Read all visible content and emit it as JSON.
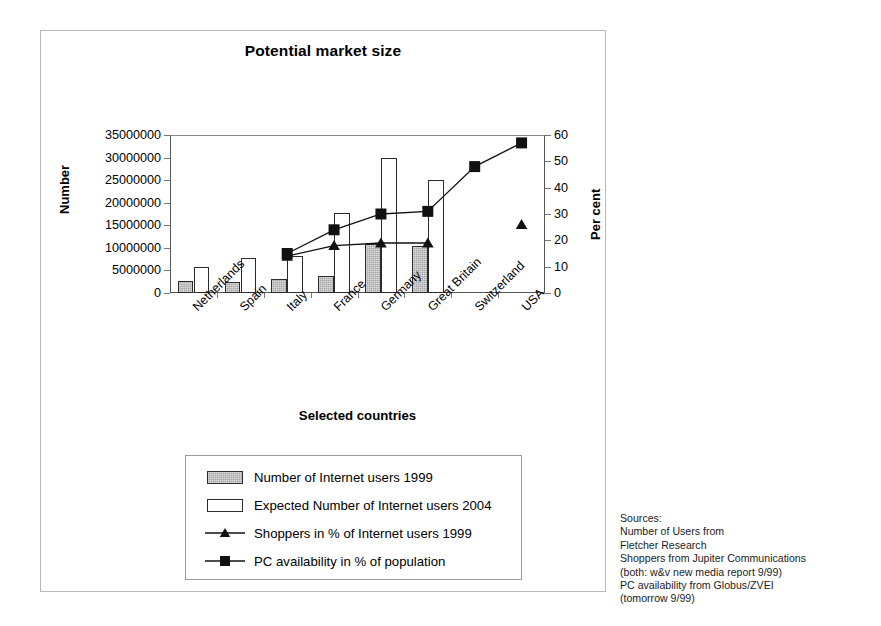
{
  "chart_data": {
    "type": "bar",
    "title": "Potential market size",
    "xlabel": "Selected countries",
    "ylabel": "Number",
    "y2label": "Per cent",
    "categories": [
      "Netherlands",
      "Spain",
      "Italy",
      "France",
      "Germany",
      "Great Britain",
      "Switzerland",
      "USA"
    ],
    "ylim": [
      0,
      35000000
    ],
    "y2lim": [
      0,
      60
    ],
    "yticks": [
      0,
      5000000,
      10000000,
      15000000,
      20000000,
      25000000,
      30000000,
      35000000
    ],
    "ytick_labels": [
      "0",
      "5000000",
      "10000000",
      "15000000",
      "20000000",
      "25000000",
      "30000000",
      "35000000"
    ],
    "y2ticks": [
      0,
      10,
      20,
      30,
      40,
      50,
      60
    ],
    "y2tick_labels": [
      "0",
      "10",
      "20",
      "30",
      "40",
      "50",
      "60"
    ],
    "grid": false,
    "legend_position": "below-plot",
    "series": [
      {
        "name": "Number of Internet users 1999",
        "type": "bar",
        "axis": "left",
        "marker": "filled-gray-rect",
        "values": [
          2600000,
          2500000,
          3000000,
          3800000,
          10800000,
          10500000,
          null,
          null
        ]
      },
      {
        "name": "Expected Number of Internet users 2004",
        "type": "bar",
        "axis": "left",
        "marker": "white-rect",
        "values": [
          5800000,
          7800000,
          8200000,
          17700000,
          30000000,
          25000000,
          null,
          null
        ]
      },
      {
        "name": "Shoppers in % of Internet users 1999",
        "type": "line",
        "axis": "right",
        "marker": "filled-triangle",
        "values": [
          null,
          null,
          14,
          18,
          19,
          19,
          null,
          26
        ]
      },
      {
        "name": "PC availability in % of population",
        "type": "line",
        "axis": "right",
        "marker": "filled-square",
        "values": [
          null,
          null,
          15,
          24,
          30,
          31,
          48,
          57
        ]
      }
    ]
  },
  "sources": {
    "lines": [
      "Sources:",
      "Number of Users from",
      "Fletcher Research",
      "Shoppers from Jupiter Communications",
      "(both: w&v new media report 9/99)",
      "PC availability from Globus/ZVEI",
      "(tomorrow 9/99)"
    ]
  },
  "colors": {
    "bar_gray": "#a8a8a8",
    "bar_white": "#ffffff",
    "marker": "#111111",
    "axis": "#555555",
    "frame": "#b9b9b9"
  }
}
